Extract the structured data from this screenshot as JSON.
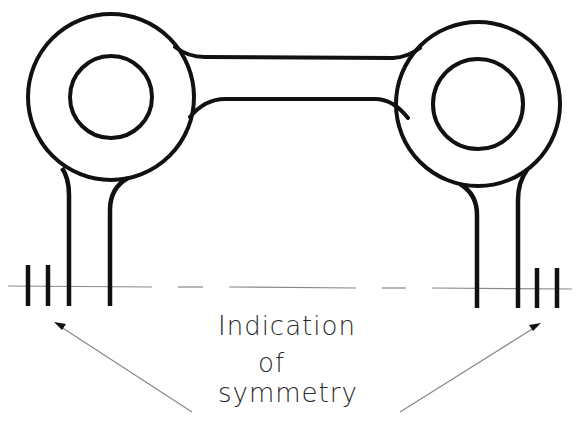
{
  "diagram": {
    "type": "technical-drawing",
    "annotation": {
      "line1": "Indication",
      "line2": "of",
      "line3": "symmetry"
    },
    "elements": [
      "left-ring-boss",
      "right-ring-boss",
      "connecting-bridge",
      "left-legs",
      "right-legs",
      "centerline",
      "left-symmetry-mark",
      "right-symmetry-mark",
      "left-leader-arrow",
      "right-leader-arrow"
    ],
    "colors": {
      "line": "#111111",
      "thin_line": "#777777",
      "background": "#ffffff"
    }
  }
}
